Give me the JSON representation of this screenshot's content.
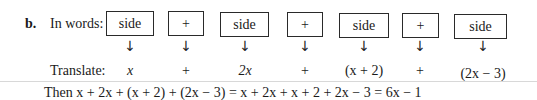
{
  "problem": {
    "label": "b.",
    "in_words_label": "In words:",
    "translate_label": "Translate:",
    "boxes": [
      {
        "text": "side"
      },
      {
        "text": "+"
      },
      {
        "text": "side"
      },
      {
        "text": "+"
      },
      {
        "text": "side"
      },
      {
        "text": "+"
      },
      {
        "text": "side"
      }
    ],
    "arrow_glyph": "↓",
    "translations": [
      {
        "text": "x"
      },
      {
        "text": "+"
      },
      {
        "text": "2x"
      },
      {
        "text": "+"
      },
      {
        "text": "(x + 2)"
      },
      {
        "text": "+"
      },
      {
        "text": "(2x − 3)"
      }
    ],
    "then_line": "Then x + 2x + (x + 2) + (2x − 3) = x + 2x + x + 2 + 2x − 3 = 6x − 1"
  }
}
